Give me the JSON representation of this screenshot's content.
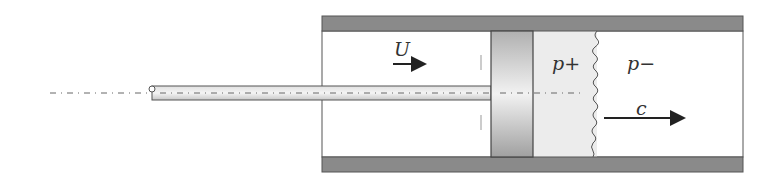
{
  "diagram": {
    "labels": {
      "piston_velocity": "U",
      "pressure_behind_shock": "p+",
      "pressure_ahead_shock": "p−",
      "shock_speed": "c"
    },
    "colors": {
      "wall": "#8a8a8a",
      "piston_dark": "#a8a8a8",
      "piston_light": "#f0f0f0",
      "shocked_gas": "#ececec",
      "outline": "#444444",
      "arrow": "#222222"
    }
  }
}
